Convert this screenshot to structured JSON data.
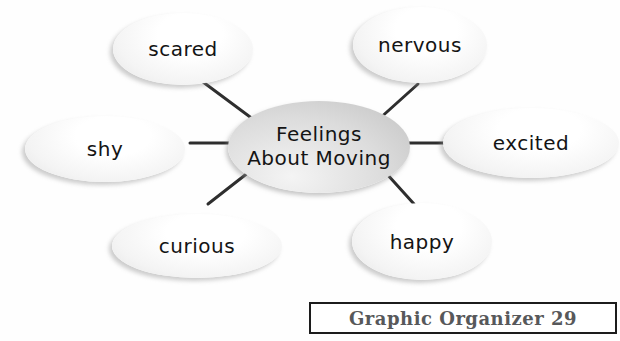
{
  "diagram": {
    "title": "Feelings About Moving graphic organizer",
    "center": {
      "label": "Feelings About Moving",
      "line1": "Feelings",
      "line2": "About Moving"
    },
    "nodes": [
      {
        "label": "scared"
      },
      {
        "label": "nervous"
      },
      {
        "label": "shy"
      },
      {
        "label": "excited"
      },
      {
        "label": "curious"
      },
      {
        "label": "happy"
      }
    ],
    "colors": {
      "outer_ellipse_fill": "#f4f4f4",
      "center_ellipse_fill": "#d0d0d0",
      "connector_line": "#2e2e2e",
      "label_text": "#141414"
    }
  },
  "footer": {
    "label": "Graphic Organizer 29",
    "text_color": "#57585a",
    "border_color": "#1c1c1c"
  }
}
